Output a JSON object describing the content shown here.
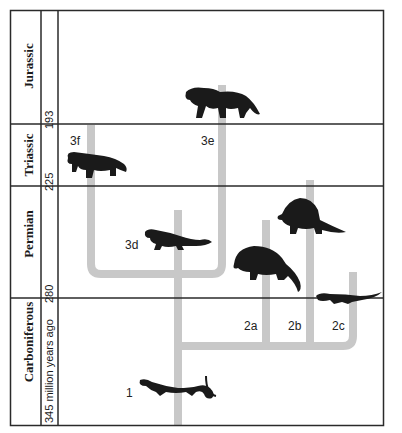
{
  "colors": {
    "border": "#2a2a2a",
    "branch": "#c8c8c8",
    "animal": "#1a1a1a",
    "background": "#ffffff"
  },
  "periods": [
    {
      "name": "Jurassic",
      "start_mya": "193"
    },
    {
      "name": "Triassic",
      "start_mya": "225"
    },
    {
      "name": "Permian",
      "start_mya": "280"
    },
    {
      "name": "Carboniferous",
      "start_mya": "345 million years ago"
    }
  ],
  "branches": [
    {
      "id": "1",
      "label": "1",
      "animal": "lizard-like early reptile"
    },
    {
      "id": "2a",
      "label": "2a",
      "animal": "edaphosaurus"
    },
    {
      "id": "2b",
      "label": "2b",
      "animal": "dimetrodon"
    },
    {
      "id": "2c",
      "label": "2c",
      "animal": "low crawling reptile"
    },
    {
      "id": "3d",
      "label": "3d",
      "animal": "long-tailed therapsid"
    },
    {
      "id": "3e",
      "label": "3e",
      "animal": "cynodont"
    },
    {
      "id": "3f",
      "label": "3f",
      "animal": "dicynodont"
    }
  ]
}
